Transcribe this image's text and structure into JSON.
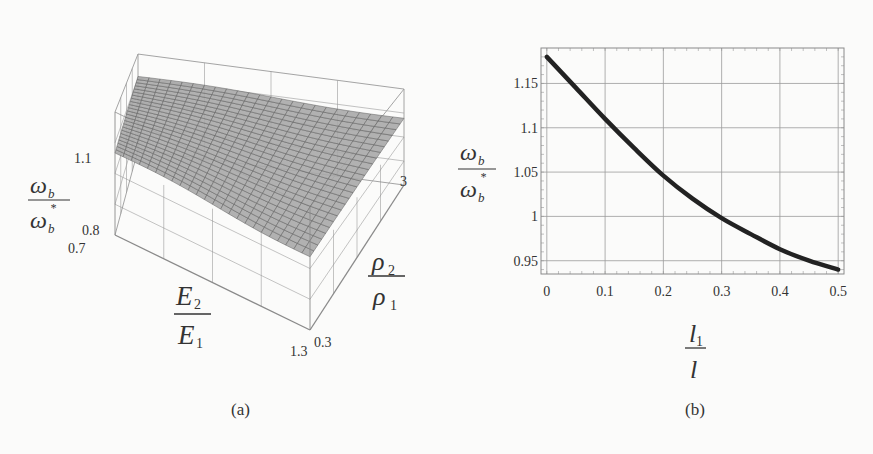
{
  "figure": {
    "panel_a": {
      "caption": "(a)"
    },
    "panel_b": {
      "caption": "(b)"
    }
  },
  "chart_data": [
    {
      "type": "surface3d",
      "panel": "(a)",
      "title": "",
      "zlabel": "ω_b / ω_b*",
      "xlabel": "E2 / E1",
      "ylabel": "ρ2 / ρ1",
      "z_ticks": [
        "1.1",
        "0.8"
      ],
      "x_ticks": [
        "0.7",
        "1.3"
      ],
      "y_ticks": [
        "0.3",
        "3"
      ],
      "zlim": [
        0.8,
        1.1
      ],
      "xlim": [
        0.7,
        1.3
      ],
      "ylim": [
        0.3,
        3
      ],
      "grid": true,
      "surface_description": "Nearly flat mesh surface around ω_b/ω_b* ≈ 1.0, slightly tilted (higher toward back corner)",
      "surface_corners": [
        {
          "E2/E1": 0.7,
          "rho2/rho1": 0.3,
          "z": 1.0
        },
        {
          "E2/E1": 0.7,
          "rho2/rho1": 3,
          "z": 1.03
        },
        {
          "E2/E1": 1.3,
          "rho2/rho1": 0.3,
          "z": 0.98
        },
        {
          "E2/E1": 1.3,
          "rho2/rho1": 3,
          "z": 1.0
        }
      ]
    },
    {
      "type": "line",
      "panel": "(b)",
      "title": "",
      "xlabel": "l1 / l",
      "ylabel": "ω_b / ω_b*",
      "x": [
        0,
        0.05,
        0.1,
        0.15,
        0.2,
        0.25,
        0.3,
        0.35,
        0.4,
        0.45,
        0.5
      ],
      "series": [
        {
          "name": "ω_b/ω_b*",
          "values": [
            1.18,
            1.145,
            1.11,
            1.077,
            1.046,
            1.02,
            0.998,
            0.98,
            0.963,
            0.95,
            0.94
          ]
        }
      ],
      "x_ticks": [
        "0",
        "0.1",
        "0.2",
        "0.3",
        "0.4",
        "0.5"
      ],
      "y_ticks": [
        "0.95",
        "1",
        "1.05",
        "1.1",
        "1.15"
      ],
      "xlim": [
        -0.01,
        0.51
      ],
      "ylim": [
        0.935,
        1.19
      ],
      "grid": true,
      "legend": "none"
    }
  ],
  "labels": {
    "a": {
      "z_num": "ω",
      "z_num_sub": "b",
      "z_den": "ω",
      "z_den_sub": "b",
      "z_den_sup": "*",
      "x_num": "E",
      "x_num_sub": "2",
      "x_den": "E",
      "x_den_sub": "1",
      "y_num": "ρ",
      "y_num_sub": "2",
      "y_den": "ρ",
      "y_den_sub": "1",
      "z_tick_top": "1.1",
      "z_tick_bot": "0.8",
      "x_tick_lo": "0.7",
      "x_tick_hi": "1.3",
      "y_tick_lo": "0.3",
      "y_tick_hi": "3"
    },
    "b": {
      "y_num": "ω",
      "y_num_sub": "b",
      "y_den": "ω",
      "y_den_sub": "b",
      "y_den_sup": "*",
      "x_num": "l",
      "x_num_sub": "1",
      "x_den": "l"
    }
  }
}
